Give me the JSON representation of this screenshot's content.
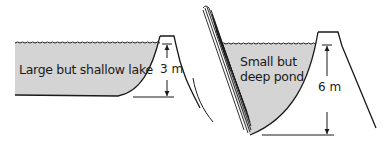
{
  "diagram": {
    "left_panel": {
      "label": "Large but shallow lake",
      "depth_label": "3 m"
    },
    "right_panel": {
      "label_line1": "Small but",
      "label_line2": "deep pond",
      "depth_label": "6 m"
    },
    "colors": {
      "water_fill": "#d4d4d4",
      "line": "#1a1a1a",
      "background": "#ffffff"
    }
  }
}
